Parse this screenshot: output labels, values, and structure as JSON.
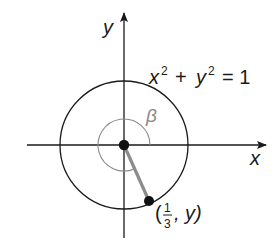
{
  "diagram": {
    "axes": {
      "x_label": "x",
      "y_label": "y"
    },
    "circle": {
      "equation_x": "x",
      "equation_y": "y",
      "equation_exp": "2",
      "equation_plus": "+",
      "equation_eq": "= 1",
      "equation_full": "x² + y² = 1"
    },
    "angle": {
      "label": "β"
    },
    "point": {
      "open_paren": "(",
      "numerator": "1",
      "denominator": "3",
      "comma_y": ", y)",
      "full": "(1/3, y)"
    },
    "colors": {
      "ink": "#1a1a1a",
      "gray": "#8a8a8a",
      "radius_gray": "#8c8c8c"
    }
  }
}
